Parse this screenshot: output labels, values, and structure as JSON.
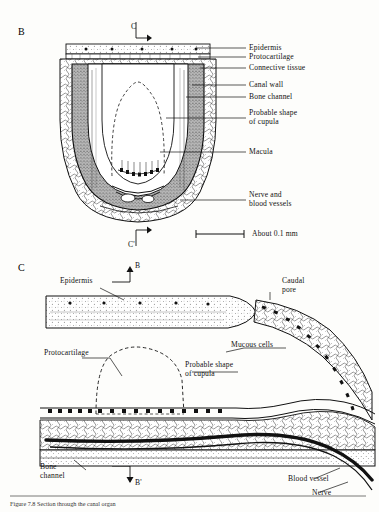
{
  "figure": {
    "panels": [
      {
        "letter": "B"
      },
      {
        "letter": "C"
      }
    ],
    "section_markers": {
      "c_top": "C",
      "c_bottom": "C'",
      "b_top": "B",
      "b_bottom": "B'"
    },
    "scale_label": "About 0.1 mm",
    "caption": "Figure 7.8 Section through the canal organ"
  },
  "panel_b": {
    "letter": "B",
    "labels": [
      {
        "id": "epidermis",
        "text": "Epidermis"
      },
      {
        "id": "protocartilage",
        "text": "Protocartilage"
      },
      {
        "id": "connective-tissue",
        "text": "Connective tissue"
      },
      {
        "id": "canal-wall",
        "text": "Canal wall"
      },
      {
        "id": "bone-channel",
        "text": "Bone channel"
      },
      {
        "id": "probable-shape-of-cupula",
        "text": "Probable shape\nof cupula"
      },
      {
        "id": "macula",
        "text": "Macula"
      },
      {
        "id": "nerve-and-blood-vessels",
        "text": "Nerve and\nblood vessels"
      }
    ],
    "section_top": "C",
    "section_bottom": "C'",
    "scale": "About 0.1 mm"
  },
  "panel_c": {
    "letter": "C",
    "labels": [
      {
        "id": "epidermis",
        "text": "Epidermis"
      },
      {
        "id": "caudal-pore",
        "text": "Caudal\npore"
      },
      {
        "id": "mucous-cells",
        "text": "Mucous cells"
      },
      {
        "id": "protocartilage",
        "text": "Protocartilage"
      },
      {
        "id": "probable-shape-of-cupula",
        "text": "Probable shape\nof cupula"
      },
      {
        "id": "bone-channel",
        "text": "Bone\nchannel"
      },
      {
        "id": "blood-vessel",
        "text": "Blood vessel"
      },
      {
        "id": "nerve",
        "text": "Nerve"
      }
    ],
    "section_top": "B",
    "section_bottom": "B'"
  }
}
